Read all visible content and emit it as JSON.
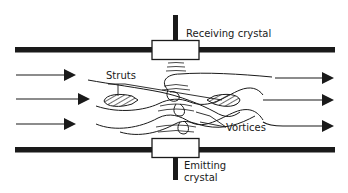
{
  "diagram": {
    "labels": {
      "receiving": "Receiving crystal",
      "struts": "Struts",
      "vortices": "Vortices",
      "emitting_line1": "Emitting",
      "emitting_line2": "crystal"
    },
    "colors": {
      "ink": "#1a1a1a",
      "background": "#ffffff"
    }
  }
}
